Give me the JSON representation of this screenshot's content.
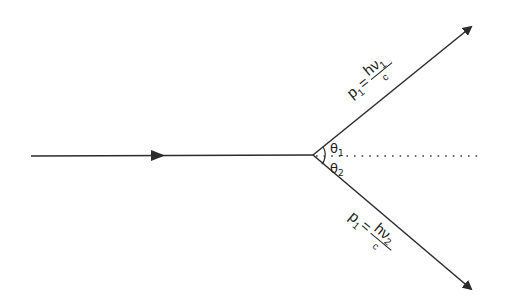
{
  "diagram": {
    "type": "photon-scattering",
    "colors": {
      "line": "#2b2b2b",
      "text": "#222222",
      "background": "#ffffff"
    },
    "vertex": {
      "x": 313,
      "y": 155
    },
    "incoming_ray": {
      "x1": 31,
      "y1": 156,
      "x2": 313,
      "y2": 155,
      "mid_arrow_x": 158
    },
    "reference_line": {
      "style": "dotted",
      "x1": 313,
      "y1": 156,
      "x2": 478,
      "y2": 156
    },
    "upper_ray": {
      "x2": 471,
      "y2": 27,
      "label": {
        "p": "p",
        "p_sub": "1",
        "eq": "=",
        "h": "h",
        "nu": "ν",
        "nu_sub": "1",
        "den": "c"
      }
    },
    "lower_ray": {
      "x2": 471,
      "y2": 289,
      "label": {
        "p": "p",
        "p_sub": "1",
        "eq": "=",
        "h": "h",
        "nu": "ν",
        "nu_sub": "2",
        "den": "c"
      }
    },
    "angles": {
      "theta1": {
        "sym": "θ",
        "sub": "1"
      },
      "theta2": {
        "sym": "θ",
        "sub": "2"
      }
    }
  }
}
